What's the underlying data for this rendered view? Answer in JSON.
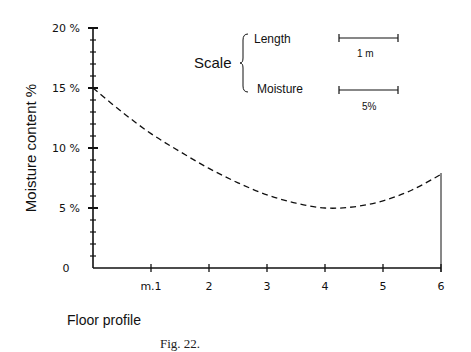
{
  "chart_data": {
    "type": "line",
    "title": "",
    "caption": "Fig. 22.",
    "xlabel": "Floor profile",
    "ylabel": "Moisture content %",
    "x_tick_labels": [
      "m.1",
      "2",
      "3",
      "4",
      "5",
      "6"
    ],
    "x_ticks": [
      1,
      2,
      3,
      4,
      5,
      6
    ],
    "y_tick_labels": [
      "0",
      "5 %",
      "10 %",
      "15 %",
      "20 %"
    ],
    "y_ticks": [
      0,
      5,
      10,
      15,
      20
    ],
    "xlim": [
      0,
      6
    ],
    "ylim": [
      0,
      20
    ],
    "grid": false,
    "legend": null,
    "series": [
      {
        "name": "Moisture content",
        "style": "dashed",
        "x": [
          0,
          0.5,
          1,
          1.5,
          2,
          2.5,
          3,
          3.5,
          4,
          4.5,
          5,
          5.5,
          6
        ],
        "values": [
          15.0,
          13.0,
          11.2,
          9.7,
          8.3,
          7.1,
          6.1,
          5.4,
          5.0,
          5.1,
          5.6,
          6.5,
          7.8
        ]
      }
    ],
    "annotations": {
      "scale_title": "Scale",
      "scale_items": [
        {
          "label": "Length",
          "value": "1 m"
        },
        {
          "label": "Moisture",
          "value": "5%"
        }
      ],
      "right_wall_line_at_x": 6
    }
  }
}
